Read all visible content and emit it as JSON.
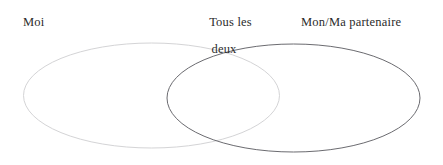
{
  "figure": {
    "type": "venn-diagram",
    "background_color": "#ffffff",
    "labels": {
      "left": "Moi",
      "center_line1": "Tous les",
      "center_line2": "deux",
      "right": "Mon/Ma partenaire"
    },
    "sets": [
      {
        "name": "moi",
        "label": "Moi",
        "stroke_color": "#d4d4d6",
        "fill": "none",
        "cx": 151.5,
        "cy": 95.5,
        "rx": 128,
        "ry": 52.5
      },
      {
        "name": "partenaire",
        "label": "Mon/Ma partenaire",
        "stroke_color": "#6b6b70",
        "fill": "none",
        "cx": 293.5,
        "cy": 98,
        "rx": 126.5,
        "ry": 54
      }
    ],
    "intersection": {
      "name": "tous-les-deux",
      "label": "Tous les deux"
    },
    "text_color": "#2b2b2b"
  }
}
